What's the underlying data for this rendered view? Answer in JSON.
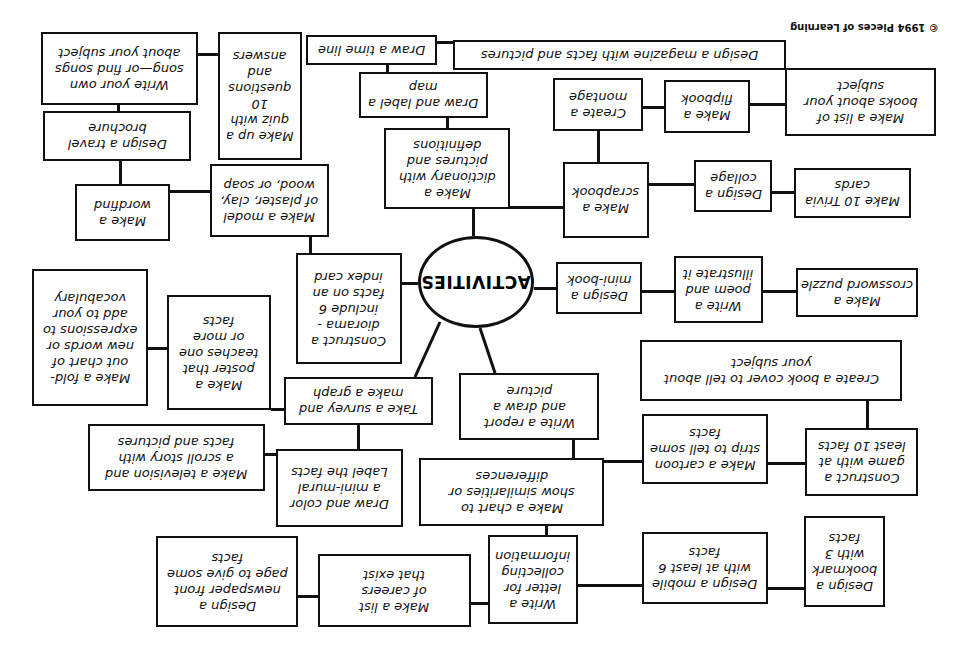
{
  "orientation": "rotated 180 degrees",
  "copyright": "© 1994 Pieces of Learning",
  "center": "ACTIVITIES",
  "boxes": [
    {
      "id": "b0",
      "text": "Write your own\nsong—or find songs\nabout your subject",
      "x": 41,
      "y": 32,
      "w": 157,
      "h": 73
    },
    {
      "id": "b1",
      "text": "Make up a\nquiz with\n10\nquestions\nand\nanswers",
      "x": 218,
      "y": 32,
      "w": 84,
      "h": 128
    },
    {
      "id": "b2",
      "text": "Draw a time line",
      "x": 306,
      "y": 35,
      "w": 131,
      "h": 30
    },
    {
      "id": "b3",
      "text": "Design a magazine with facts and pictures",
      "x": 453,
      "y": 40,
      "w": 333,
      "h": 30
    },
    {
      "id": "b4",
      "text": "Make a list of\nbooks about your\nsubject",
      "x": 785,
      "y": 68,
      "w": 151,
      "h": 68
    },
    {
      "id": "b5",
      "text": "Make a\nflipbook",
      "x": 664,
      "y": 80,
      "w": 86,
      "h": 53
    },
    {
      "id": "b6",
      "text": "Create a\nmontage",
      "x": 553,
      "y": 78,
      "w": 90,
      "h": 53
    },
    {
      "id": "b7",
      "text": "Draw and label a\nmap",
      "x": 359,
      "y": 72,
      "w": 129,
      "h": 46
    },
    {
      "id": "b8",
      "text": "Design a travel\nbrochure",
      "x": 43,
      "y": 111,
      "w": 148,
      "h": 50
    },
    {
      "id": "b9",
      "text": "Make a\ndictionary with\npictures and\ndefinitions",
      "x": 384,
      "y": 128,
      "w": 126,
      "h": 81
    },
    {
      "id": "b10",
      "text": "Make a\nscrapbook",
      "x": 563,
      "y": 162,
      "w": 86,
      "h": 76
    },
    {
      "id": "b11",
      "text": "Design a\ncollage",
      "x": 694,
      "y": 160,
      "w": 78,
      "h": 52
    },
    {
      "id": "b12",
      "text": "Make 10 Trivia\ncards",
      "x": 794,
      "y": 168,
      "w": 117,
      "h": 50
    },
    {
      "id": "b13",
      "text": "Make a\nwordfind",
      "x": 75,
      "y": 184,
      "w": 95,
      "h": 57
    },
    {
      "id": "b14",
      "text": "Make a model\nof plaster, clay,\nwood, or soap",
      "x": 210,
      "y": 164,
      "w": 119,
      "h": 73
    },
    {
      "id": "b15",
      "text": "Construct a\ndiorama -\ninclude 6\nfacts on an\nindex card",
      "x": 296,
      "y": 253,
      "w": 106,
      "h": 111
    },
    {
      "id": "b16",
      "text": "Design a\nmini-book",
      "x": 556,
      "y": 262,
      "w": 86,
      "h": 52
    },
    {
      "id": "b17",
      "text": "Write a\npoem and\nillustrate it",
      "x": 674,
      "y": 256,
      "w": 89,
      "h": 67
    },
    {
      "id": "b18",
      "text": "Make a\ncrossword puzzle",
      "x": 796,
      "y": 268,
      "w": 122,
      "h": 49
    },
    {
      "id": "b19",
      "text": "Make a fold-\nout chart of\nnew words or\nexpressions to\nadd to your\nvocabulary",
      "x": 32,
      "y": 269,
      "w": 116,
      "h": 137
    },
    {
      "id": "b20",
      "text": "Make a\nposter that\nteaches one\nor more\nfacts",
      "x": 167,
      "y": 295,
      "w": 104,
      "h": 115
    },
    {
      "id": "b21",
      "text": "Create a book cover to tell about\nyour subject",
      "x": 640,
      "y": 340,
      "w": 262,
      "h": 61
    },
    {
      "id": "b22",
      "text": "Take a survey and\nmake a graph",
      "x": 284,
      "y": 377,
      "w": 149,
      "h": 48
    },
    {
      "id": "b23",
      "text": "Write a report\nand draw a\npicture",
      "x": 459,
      "y": 373,
      "w": 140,
      "h": 67
    },
    {
      "id": "b24",
      "text": "Make a television and\na scroll story with\nfacts and pictures",
      "x": 88,
      "y": 424,
      "w": 177,
      "h": 67
    },
    {
      "id": "b25",
      "text": "Draw and color\na mini-mural\nLabel the facts",
      "x": 276,
      "y": 449,
      "w": 127,
      "h": 78
    },
    {
      "id": "b26",
      "text": "Make a chart to\nshow similarities or\ndifferences",
      "x": 419,
      "y": 458,
      "w": 185,
      "h": 68
    },
    {
      "id": "b27",
      "text": "Make a cartoon\nstrip to tell some\nfacts",
      "x": 642,
      "y": 414,
      "w": 126,
      "h": 70
    },
    {
      "id": "b28",
      "text": "Construct a\ngame with at\nleast 10 facts",
      "x": 805,
      "y": 428,
      "w": 113,
      "h": 68
    },
    {
      "id": "b29",
      "text": "Design a\nnewspaper front\npage to give some\nfacts",
      "x": 156,
      "y": 536,
      "w": 142,
      "h": 91
    },
    {
      "id": "b30",
      "text": "Make a list\nof careers\nthat exist",
      "x": 318,
      "y": 554,
      "w": 153,
      "h": 73
    },
    {
      "id": "b31",
      "text": "Write a\nletter for\ncollecting\ninformation",
      "x": 488,
      "y": 535,
      "w": 90,
      "h": 89
    },
    {
      "id": "b32",
      "text": "Design a mobile\nwith at least 6\nfacts",
      "x": 642,
      "y": 532,
      "w": 126,
      "h": 72
    },
    {
      "id": "b33",
      "text": "Design a\nbookmark\nwith 3\nfacts",
      "x": 804,
      "y": 516,
      "w": 81,
      "h": 91
    }
  ],
  "lines": [
    {
      "x": 198,
      "y": 53,
      "w": 20,
      "h": 3
    },
    {
      "x": 437,
      "y": 41,
      "w": 16,
      "h": 3
    },
    {
      "x": 386,
      "y": 65,
      "w": 3,
      "h": 7
    },
    {
      "x": 446,
      "y": 118,
      "w": 3,
      "h": 10
    },
    {
      "x": 750,
      "y": 103,
      "w": 35,
      "h": 3
    },
    {
      "x": 643,
      "y": 106,
      "w": 21,
      "h": 3
    },
    {
      "x": 597,
      "y": 131,
      "w": 3,
      "h": 31
    },
    {
      "x": 117,
      "y": 105,
      "w": 3,
      "h": 6
    },
    {
      "x": 119,
      "y": 161,
      "w": 3,
      "h": 23
    },
    {
      "x": 170,
      "y": 190,
      "w": 40,
      "h": 3
    },
    {
      "x": 649,
      "y": 183,
      "w": 45,
      "h": 3
    },
    {
      "x": 772,
      "y": 191,
      "w": 22,
      "h": 3
    },
    {
      "x": 510,
      "y": 206,
      "w": 53,
      "h": 3
    },
    {
      "x": 309,
      "y": 237,
      "w": 3,
      "h": 16
    },
    {
      "x": 472,
      "y": 209,
      "w": 3,
      "h": 27
    },
    {
      "x": 402,
      "y": 282,
      "w": 16,
      "h": 3
    },
    {
      "x": 534,
      "y": 287,
      "w": 22,
      "h": 3
    },
    {
      "x": 642,
      "y": 290,
      "w": 32,
      "h": 3
    },
    {
      "x": 763,
      "y": 290,
      "w": 33,
      "h": 3
    },
    {
      "x": 148,
      "y": 347,
      "w": 19,
      "h": 3
    },
    {
      "x": 271,
      "y": 408,
      "w": 13,
      "h": 3
    },
    {
      "x": 866,
      "y": 401,
      "w": 3,
      "h": 27
    },
    {
      "x": 357,
      "y": 425,
      "w": 3,
      "h": 24
    },
    {
      "x": 265,
      "y": 453,
      "w": 11,
      "h": 3
    },
    {
      "x": 572,
      "y": 440,
      "w": 3,
      "h": 18
    },
    {
      "x": 604,
      "y": 460,
      "w": 38,
      "h": 3
    },
    {
      "x": 768,
      "y": 462,
      "w": 37,
      "h": 3
    },
    {
      "x": 545,
      "y": 526,
      "w": 3,
      "h": 9
    },
    {
      "x": 298,
      "y": 595,
      "w": 20,
      "h": 3
    },
    {
      "x": 471,
      "y": 602,
      "w": 17,
      "h": 3
    },
    {
      "x": 578,
      "y": 584,
      "w": 64,
      "h": 3
    },
    {
      "x": 768,
      "y": 587,
      "w": 36,
      "h": 3
    }
  ],
  "diagonals": [
    {
      "x1": 440,
      "y1": 322,
      "x2": 415,
      "y2": 377
    },
    {
      "x1": 480,
      "y1": 328,
      "x2": 495,
      "y2": 373
    }
  ]
}
